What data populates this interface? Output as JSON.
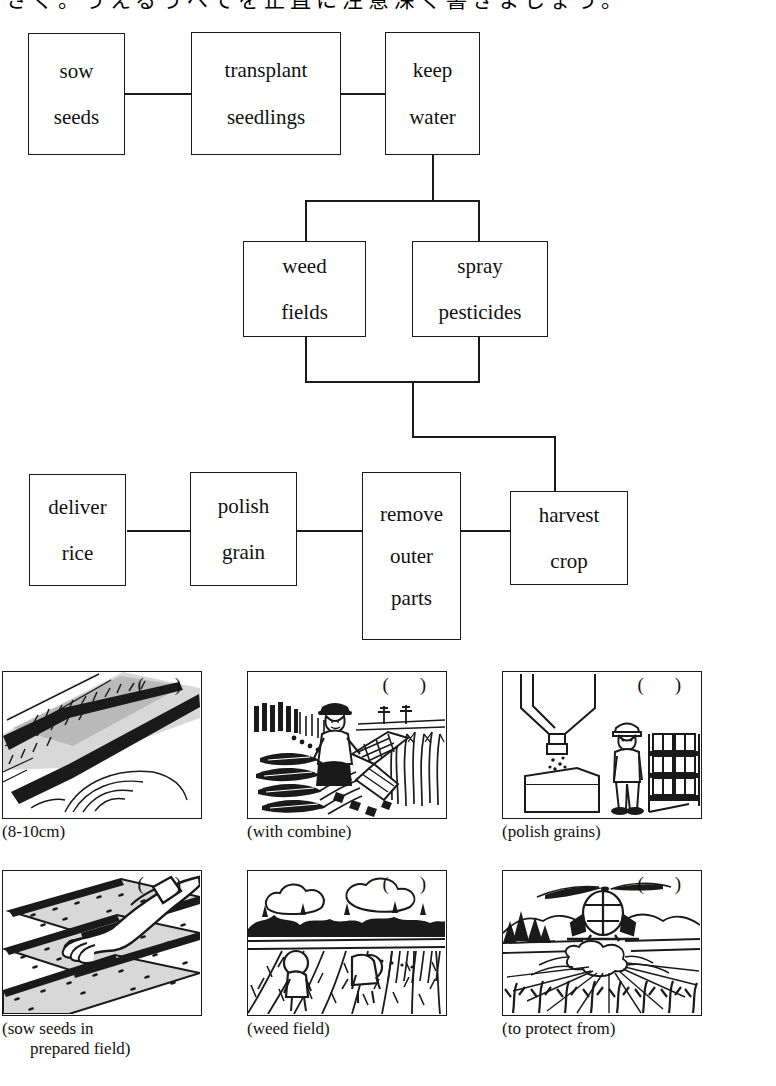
{
  "header": {
    "cut_off_japanese_line": "さく。うえるうべてを正直に注意深く書きましょう。"
  },
  "flowchart": {
    "title": "rice farming process flow chart",
    "nodes": [
      {
        "id": "sow-seeds",
        "lines": [
          "sow",
          "seeds"
        ]
      },
      {
        "id": "transplant-seedlings",
        "lines": [
          "transplant",
          "seedlings"
        ]
      },
      {
        "id": "keep-water",
        "lines": [
          "keep",
          "water"
        ]
      },
      {
        "id": "weed-fields",
        "lines": [
          "weed",
          "fields"
        ]
      },
      {
        "id": "spray-pesticides",
        "lines": [
          "spray",
          "pesticides"
        ]
      },
      {
        "id": "deliver-rice",
        "lines": [
          "deliver",
          "rice"
        ]
      },
      {
        "id": "polish-grain",
        "lines": [
          "polish",
          "grain"
        ]
      },
      {
        "id": "remove-outer-parts",
        "lines": [
          "remove",
          "outer",
          "parts"
        ]
      },
      {
        "id": "harvest-crop",
        "lines": [
          "harvest",
          "crop"
        ]
      }
    ]
  },
  "panels": [
    {
      "id": "keep-water-photo",
      "blank": "(  )",
      "caption": "(8-10cm)",
      "caption_line2": ""
    },
    {
      "id": "harvest-photo",
      "blank": "(  )",
      "caption": "(with combine)",
      "caption_line2": ""
    },
    {
      "id": "polish-photo",
      "blank": "(  )",
      "caption": "(polish grains)",
      "caption_line2": ""
    },
    {
      "id": "sow-seeds-photo",
      "blank": "(  )",
      "caption": "(sow seeds in",
      "caption_line2": "prepared field)"
    },
    {
      "id": "weed-field-photo",
      "blank": "(  )",
      "caption": "(weed field)",
      "caption_line2": ""
    },
    {
      "id": "spray-photo",
      "blank": "(  )",
      "caption": "(to protect from)",
      "caption_line2": ""
    }
  ],
  "colors": {
    "ink": "#1a1a1a",
    "paper": "#ffffff",
    "shade": "#b9b9b9",
    "shade_light": "#d8d8d8"
  }
}
